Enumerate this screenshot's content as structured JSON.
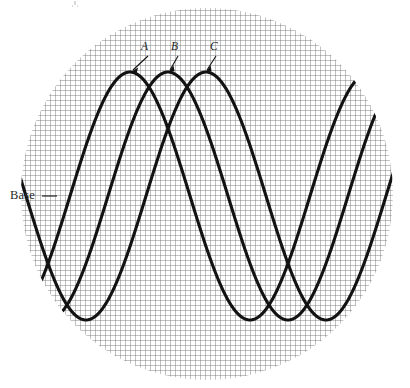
{
  "figure": {
    "title": "",
    "background_color": "#ffffff",
    "clip_shape": "circle",
    "circle": {
      "cx": 207,
      "cy": 194,
      "r": 186
    },
    "grid": {
      "cell_size": 5,
      "color": "#6d6d6d",
      "style": "uniform-square-mesh"
    }
  },
  "labels": {
    "base": {
      "text": "Base",
      "x": 10,
      "y": 199
    },
    "curve_a": {
      "text": "A",
      "x": 141,
      "y": 50
    },
    "curve_b": {
      "text": "B",
      "x": 171,
      "y": 50
    },
    "curve_c": {
      "text": "C",
      "x": 210,
      "y": 50
    }
  },
  "chart_data": {
    "type": "line",
    "title": "",
    "xlabel": "",
    "ylabel": "",
    "grid": true,
    "legend_position": "inline-callout",
    "axis_note": "Base line indicated at left margin",
    "x": [
      0,
      410
    ],
    "ylim": [
      72,
      320
    ],
    "baseline_y": 196,
    "series": [
      {
        "name": "A",
        "label": "A",
        "color": "#121212",
        "waveform": "sine",
        "amplitude": 124,
        "midline": 196,
        "period": 240,
        "peak_x": 130,
        "peak_y": 72,
        "trough_x": 250,
        "trough_y": 320,
        "start_point": [
          46,
          262
        ],
        "end_point": [
          362,
          84
        ]
      },
      {
        "name": "B",
        "label": "B",
        "color": "#121212",
        "waveform": "sine",
        "amplitude": 124,
        "midline": 196,
        "period": 240,
        "peak_x": 168,
        "peak_y": 72,
        "trough_x": 288,
        "trough_y": 320,
        "start_point": [
          64,
          296
        ],
        "end_point": [
          380,
          108
        ]
      },
      {
        "name": "C",
        "label": "C",
        "color": "#121212",
        "waveform": "sine",
        "amplitude": 124,
        "midline": 196,
        "period": 240,
        "peak_x": 206,
        "peak_y": 72,
        "trough_x": 326,
        "trough_y": 320,
        "start_point": [
          82,
          322
        ],
        "end_point": [
          396,
          152
        ]
      }
    ]
  }
}
